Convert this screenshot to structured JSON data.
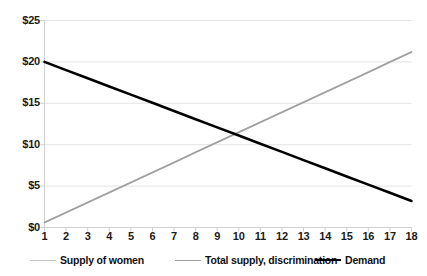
{
  "chart_data": {
    "type": "line",
    "title": "",
    "subtitle": "",
    "xlabel": "",
    "ylabel": "",
    "x": [
      1,
      2,
      3,
      4,
      5,
      6,
      7,
      8,
      9,
      10,
      11,
      12,
      13,
      14,
      15,
      16,
      17,
      18
    ],
    "xlim": [
      1,
      18
    ],
    "ylim": [
      0,
      25
    ],
    "xtick_labels": [
      "1",
      "2",
      "3",
      "4",
      "5",
      "6",
      "7",
      "8",
      "9",
      "10",
      "11",
      "12",
      "13",
      "14",
      "15",
      "16",
      "17",
      "18"
    ],
    "ytick_values": [
      0,
      5,
      10,
      15,
      20,
      25
    ],
    "ytick_labels": [
      "$0",
      "$5",
      "$10",
      "$15",
      "$20",
      "$25"
    ],
    "grid": true,
    "grid_axis": "y",
    "legend_position": "bottom",
    "series": [
      {
        "name": "Supply of women",
        "color": "#c8c8c8",
        "width": 1.6,
        "endpoints": [
          {
            "x": 1,
            "y": 0.6
          },
          {
            "x": 18,
            "y": 21.2
          }
        ],
        "values": [
          0.6,
          1.81,
          3.02,
          4.23,
          5.44,
          6.65,
          7.86,
          9.08,
          10.29,
          11.5,
          12.71,
          13.92,
          15.13,
          16.34,
          17.55,
          18.76,
          19.98,
          21.2
        ]
      },
      {
        "name": "Total supply, discrimination",
        "color": "#a0a0a0",
        "width": 1.6,
        "endpoints": [
          {
            "x": 1,
            "y": 0.6
          },
          {
            "x": 18,
            "y": 21.2
          }
        ],
        "values": [
          0.6,
          1.81,
          3.02,
          4.23,
          5.44,
          6.65,
          7.86,
          9.08,
          10.29,
          11.5,
          12.71,
          13.92,
          15.13,
          16.34,
          17.55,
          18.76,
          19.98,
          21.2
        ]
      },
      {
        "name": "Demand",
        "color": "#000000",
        "width": 2.6,
        "endpoints": [
          {
            "x": 1,
            "y": 20.0
          },
          {
            "x": 18,
            "y": 3.2
          }
        ],
        "values": [
          20.0,
          19.01,
          18.02,
          17.04,
          16.05,
          15.06,
          14.07,
          13.08,
          12.09,
          11.11,
          10.12,
          9.13,
          8.14,
          7.15,
          6.16,
          5.18,
          4.19,
          3.2
        ]
      }
    ],
    "annotations": []
  },
  "legend": [
    {
      "label": "Supply of women",
      "color": "#c8c8c8",
      "width": 1.6
    },
    {
      "label": "Total supply, discrimination",
      "color": "#a0a0a0",
      "width": 1.6
    },
    {
      "label": "Demand",
      "color": "#000000",
      "width": 2.6
    }
  ],
  "colors": {
    "background": "#ffffff",
    "gridline": "#e4e4e4",
    "axis": "#d0d0d0",
    "text": "#1a1a1a"
  }
}
